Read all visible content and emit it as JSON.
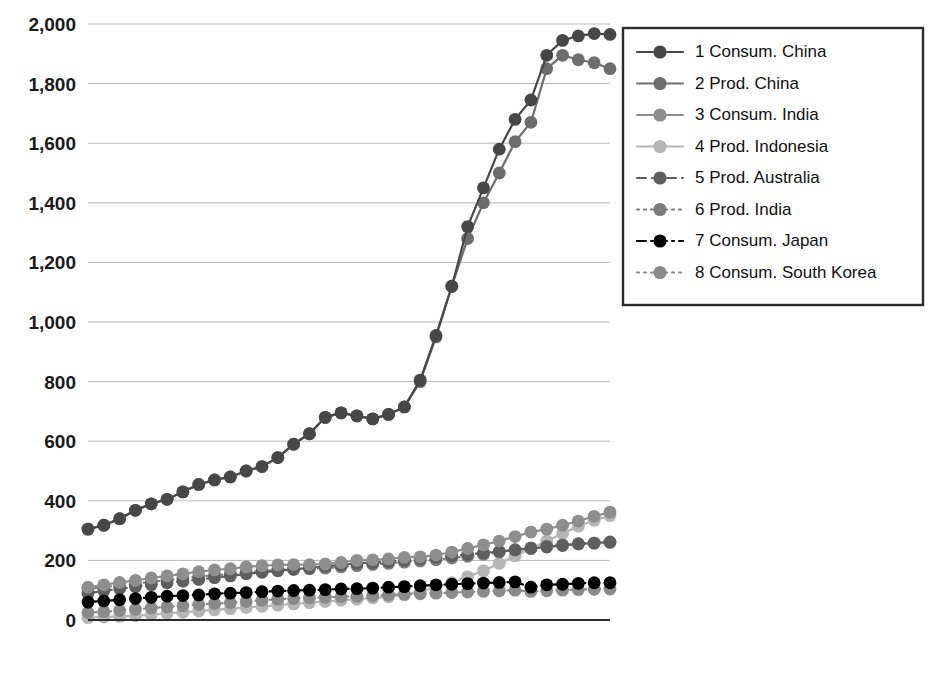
{
  "chart_data": {
    "type": "line",
    "title": "",
    "subtitle": "",
    "xlabel": "",
    "ylabel": "",
    "grid": true,
    "legend_position": "right",
    "ylim": [
      0,
      2000
    ],
    "ytick_labels": [
      "2,000",
      "1,800",
      "1,600",
      "1,400",
      "1,200",
      "1,000",
      "800",
      "600",
      "400",
      "200",
      "0"
    ],
    "ytick_values": [
      2000,
      1800,
      1600,
      1400,
      1200,
      1000,
      800,
      600,
      400,
      200,
      0
    ],
    "x": [
      1981,
      1982,
      1983,
      1984,
      1985,
      1986,
      1987,
      1988,
      1989,
      1990,
      1991,
      1992,
      1993,
      1994,
      1995,
      1996,
      1997,
      1998,
      1999,
      2000,
      2001,
      2002,
      2003,
      2004,
      2005,
      2006,
      2007,
      2008,
      2009,
      2010,
      2011,
      2012,
      2013,
      2014
    ],
    "xtick_labels": [
      "1981",
      "1983",
      "1985",
      "1987",
      "1989",
      "1991",
      "1993",
      "1995",
      "1997",
      "1999",
      "2001",
      "2003",
      "2005",
      "2007",
      "2009",
      "2011",
      "2013"
    ],
    "xtick_values": [
      1981,
      1983,
      1985,
      1987,
      1989,
      1991,
      1993,
      1995,
      1997,
      1999,
      2001,
      2003,
      2005,
      2007,
      2009,
      2011,
      2013
    ],
    "series": [
      {
        "name": "1 Consum. China",
        "label": "1 Consum. China",
        "color": "#474747",
        "dash": "solid",
        "values": [
          305,
          318,
          340,
          368,
          390,
          405,
          430,
          455,
          470,
          480,
          500,
          515,
          545,
          590,
          625,
          680,
          695,
          685,
          675,
          690,
          715,
          805,
          955,
          1120,
          1320,
          1450,
          1580,
          1680,
          1745,
          1895,
          1945,
          1960,
          1968,
          1965
        ]
      },
      {
        "name": "2 Prod. China",
        "label": "2 Prod. China",
        "color": "#6d6d6d",
        "dash": "solid",
        "values": [
          305,
          318,
          340,
          368,
          390,
          405,
          430,
          455,
          470,
          480,
          500,
          515,
          545,
          590,
          625,
          680,
          695,
          685,
          675,
          690,
          715,
          800,
          950,
          1120,
          1280,
          1400,
          1500,
          1605,
          1670,
          1850,
          1895,
          1880,
          1870,
          1850
        ]
      },
      {
        "name": "3 Consum. India",
        "label": "3 Consum. India",
        "color": "#8e8e8e",
        "dash": "solid",
        "values": [
          110,
          118,
          126,
          133,
          141,
          148,
          155,
          162,
          168,
          172,
          178,
          182,
          185,
          186,
          186,
          188,
          193,
          200,
          202,
          205,
          210,
          212,
          218,
          228,
          240,
          252,
          265,
          280,
          295,
          305,
          318,
          332,
          348,
          362
        ]
      },
      {
        "name": "4 Prod. Indonesia",
        "label": "4 Prod. Indonesia",
        "color": "#b5b5b5",
        "dash": "solid",
        "values": [
          8,
          10,
          12,
          14,
          18,
          22,
          26,
          30,
          34,
          38,
          42,
          46,
          50,
          54,
          58,
          62,
          66,
          70,
          74,
          78,
          85,
          95,
          110,
          125,
          145,
          165,
          190,
          215,
          240,
          265,
          290,
          315,
          335,
          350
        ]
      },
      {
        "name": "5 Prod. Australia",
        "label": "5 Prod. Australia",
        "color": "#5e5e5e",
        "dash": "dashed",
        "values": [
          90,
          98,
          105,
          112,
          118,
          125,
          130,
          136,
          142,
          148,
          155,
          160,
          165,
          170,
          175,
          180,
          185,
          190,
          193,
          196,
          200,
          205,
          210,
          215,
          220,
          225,
          230,
          235,
          240,
          245,
          250,
          255,
          258,
          262
        ]
      },
      {
        "name": "6 Prod. India",
        "label": "6 Prod. India",
        "color": "#7c7c7c",
        "dash": "dotted",
        "values": [
          104,
          110,
          116,
          122,
          128,
          134,
          140,
          146,
          150,
          155,
          160,
          164,
          168,
          170,
          172,
          174,
          178,
          182,
          186,
          190,
          194,
          198,
          202,
          208,
          214,
          220,
          228,
          236,
          242,
          248,
          252,
          256,
          258,
          260
        ]
      },
      {
        "name": "7 Consum. Japan",
        "label": "7 Consum. Japan",
        "color": "#000000",
        "dash": "dashdot",
        "values": [
          60,
          64,
          68,
          72,
          76,
          80,
          82,
          84,
          88,
          90,
          92,
          95,
          97,
          99,
          100,
          102,
          104,
          105,
          107,
          110,
          112,
          115,
          118,
          120,
          122,
          124,
          126,
          128,
          110,
          118,
          120,
          123,
          125,
          125
        ]
      },
      {
        "name": "8 Consum. South Korea",
        "label": "8 Consum. South Korea",
        "color": "#8a8a8a",
        "dash": "dotted",
        "values": [
          25,
          28,
          32,
          36,
          40,
          44,
          48,
          52,
          55,
          58,
          62,
          66,
          70,
          72,
          74,
          76,
          78,
          80,
          82,
          84,
          86,
          88,
          90,
          92,
          94,
          96,
          98,
          100,
          96,
          98,
          100,
          102,
          103,
          104
        ]
      }
    ]
  }
}
